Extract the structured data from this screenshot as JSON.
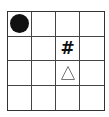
{
  "board": {
    "rows": 4,
    "cols": 4,
    "grid_color": "#444444",
    "pieces": [
      {
        "type": "circle",
        "row": 0,
        "col": 0,
        "icon": "filled-circle-icon",
        "color": "#111111"
      },
      {
        "type": "hash",
        "row": 1,
        "col": 2,
        "symbol": "#",
        "icon": "hash-icon"
      },
      {
        "type": "triangle",
        "row": 2,
        "col": 2,
        "icon": "outlined-triangle-icon",
        "color": "#777777"
      }
    ]
  },
  "symbols": {
    "hash": "#"
  }
}
